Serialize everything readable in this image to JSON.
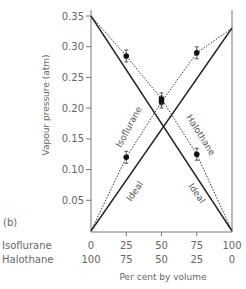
{
  "panel_label": "(b)",
  "chart_data": {
    "type": "line",
    "title": "",
    "xlabel": "Per cent by volume",
    "ylabel": "Vapour pressure (atm)",
    "ylim": [
      0,
      0.35
    ],
    "xlim": [
      0,
      100
    ],
    "grid": false,
    "legend": "none (curves labelled inline)",
    "x_axis_rows": [
      {
        "name": "Isoflurane",
        "ticks": [
          "0",
          "25",
          "50",
          "75",
          "100"
        ]
      },
      {
        "name": "Halothane",
        "ticks": [
          "100",
          "75",
          "50",
          "25",
          "0"
        ]
      }
    ],
    "y_ticks": [
      "0.05",
      "0.10",
      "0.15",
      "0.20",
      "0.25",
      "0.30",
      "0.35"
    ],
    "x": [
      0,
      25,
      50,
      75,
      100
    ],
    "series": [
      {
        "name": "Isoflurane (measured)",
        "style": "dotted",
        "x": [
          0,
          25,
          50,
          75,
          100
        ],
        "values": [
          0.0,
          0.12,
          0.21,
          0.29,
          0.33
        ],
        "markers_at": [
          25,
          50,
          75
        ]
      },
      {
        "name": "Halothane (measured)",
        "style": "dotted",
        "x": [
          0,
          25,
          50,
          75,
          100
        ],
        "values": [
          0.35,
          0.285,
          0.215,
          0.125,
          0.0
        ],
        "markers_at": [
          25,
          50,
          75
        ]
      },
      {
        "name": "Isoflurane Ideal",
        "style": "solid",
        "x": [
          0,
          100
        ],
        "values": [
          0.0,
          0.33
        ]
      },
      {
        "name": "Halothane Ideal",
        "style": "solid",
        "x": [
          0,
          100
        ],
        "values": [
          0.35,
          0.0
        ]
      }
    ],
    "annotations": [
      "Isoflurane",
      "Halothane",
      "Ideal",
      "Ideal"
    ]
  },
  "labels": {
    "isoflurane": "Isoflurane",
    "halothane": "Halothane",
    "ideal": "Ideal",
    "row_isoflurane": "Isoflurane",
    "row_halothane": "Halothane"
  }
}
